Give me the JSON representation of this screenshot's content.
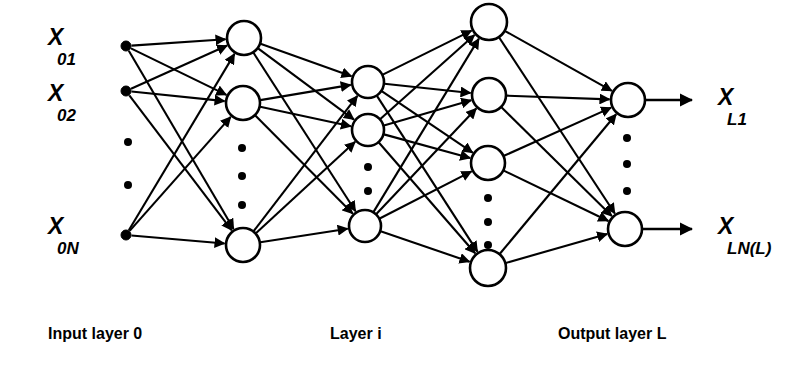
{
  "figure": {
    "kind": "neural-network-diagram",
    "background_color": "#ffffff",
    "stroke_color": "#000000",
    "node_fill_color": "#ffffff"
  },
  "input_labels": [
    {
      "base": "X",
      "sub": "01",
      "x": 48,
      "y": 26
    },
    {
      "base": "X",
      "sub": "02",
      "x": 48,
      "y": 82
    },
    {
      "base": "X",
      "sub": "0N",
      "x": 48,
      "y": 215
    }
  ],
  "output_labels": [
    {
      "base": "X",
      "sub": "L1",
      "x": 718,
      "y": 86
    },
    {
      "base": "X",
      "sub": "LN(L)",
      "x": 718,
      "y": 215
    }
  ],
  "captions": [
    {
      "text": "Input layer 0",
      "x": 48,
      "y": 326
    },
    {
      "text": "Layer i",
      "x": 330,
      "y": 326
    },
    {
      "text": "Output layer L",
      "x": 558,
      "y": 326
    }
  ],
  "layers": [
    {
      "name": "input-layer-0",
      "node_style": "filled-dot",
      "nodes": [
        {
          "id": "in-1",
          "cx": 126,
          "cy": 46,
          "r": 5
        },
        {
          "id": "in-2",
          "cx": 126,
          "cy": 91,
          "r": 5
        },
        {
          "id": "in-3",
          "cx": 126,
          "cy": 235,
          "r": 5
        }
      ],
      "ellipsis": [
        {
          "cx": 128,
          "cy": 142,
          "r": 4
        },
        {
          "cx": 128,
          "cy": 185,
          "r": 4
        }
      ]
    },
    {
      "name": "hidden-layer-1",
      "node_style": "open-circle",
      "nodes": [
        {
          "id": "h1-1",
          "cx": 244,
          "cy": 38,
          "r": 17
        },
        {
          "id": "h1-2",
          "cx": 243,
          "cy": 103,
          "r": 17
        },
        {
          "id": "h1-3",
          "cx": 243,
          "cy": 245,
          "r": 17
        }
      ],
      "ellipsis": [
        {
          "cx": 242,
          "cy": 148,
          "r": 4
        },
        {
          "cx": 242,
          "cy": 176,
          "r": 4
        },
        {
          "cx": 242,
          "cy": 205,
          "r": 4
        }
      ]
    },
    {
      "name": "hidden-layer-i",
      "node_style": "open-circle",
      "nodes": [
        {
          "id": "h2-1",
          "cx": 368,
          "cy": 82,
          "r": 16
        },
        {
          "id": "h2-2",
          "cx": 368,
          "cy": 130,
          "r": 16
        },
        {
          "id": "h2-3",
          "cx": 365,
          "cy": 226,
          "r": 16
        }
      ],
      "ellipsis": [
        {
          "cx": 368,
          "cy": 167,
          "r": 4
        },
        {
          "cx": 368,
          "cy": 191,
          "r": 4
        }
      ]
    },
    {
      "name": "hidden-layer-next",
      "node_style": "open-circle",
      "nodes": [
        {
          "id": "h3-1",
          "cx": 489,
          "cy": 22,
          "r": 18
        },
        {
          "id": "h3-2",
          "cx": 489,
          "cy": 95,
          "r": 17
        },
        {
          "id": "h3-3",
          "cx": 488,
          "cy": 163,
          "r": 17
        },
        {
          "id": "h3-4",
          "cx": 488,
          "cy": 268,
          "r": 18
        }
      ],
      "ellipsis": [
        {
          "cx": 488,
          "cy": 198,
          "r": 4
        },
        {
          "cx": 488,
          "cy": 222,
          "r": 4
        },
        {
          "cx": 488,
          "cy": 245,
          "r": 4
        }
      ]
    },
    {
      "name": "output-layer-L",
      "node_style": "open-circle",
      "nodes": [
        {
          "id": "out-1",
          "cx": 628,
          "cy": 100,
          "r": 17
        },
        {
          "id": "out-2",
          "cx": 625,
          "cy": 229,
          "r": 17
        }
      ],
      "ellipsis": [
        {
          "cx": 627,
          "cy": 138,
          "r": 4
        },
        {
          "cx": 627,
          "cy": 164,
          "r": 4
        },
        {
          "cx": 627,
          "cy": 191,
          "r": 4
        }
      ]
    }
  ],
  "connections": [
    {
      "from": "in-1",
      "to": "h1-1"
    },
    {
      "from": "in-1",
      "to": "h1-2"
    },
    {
      "from": "in-1",
      "to": "h1-3"
    },
    {
      "from": "in-2",
      "to": "h1-1"
    },
    {
      "from": "in-2",
      "to": "h1-2"
    },
    {
      "from": "in-2",
      "to": "h1-3"
    },
    {
      "from": "in-3",
      "to": "h1-1"
    },
    {
      "from": "in-3",
      "to": "h1-2"
    },
    {
      "from": "in-3",
      "to": "h1-3"
    },
    {
      "from": "h1-1",
      "to": "h2-1"
    },
    {
      "from": "h1-1",
      "to": "h2-2"
    },
    {
      "from": "h1-1",
      "to": "h2-3"
    },
    {
      "from": "h1-2",
      "to": "h2-1"
    },
    {
      "from": "h1-2",
      "to": "h2-2"
    },
    {
      "from": "h1-2",
      "to": "h2-3"
    },
    {
      "from": "h1-3",
      "to": "h2-1"
    },
    {
      "from": "h1-3",
      "to": "h2-2"
    },
    {
      "from": "h1-3",
      "to": "h2-3"
    },
    {
      "from": "h2-1",
      "to": "h3-1"
    },
    {
      "from": "h2-1",
      "to": "h3-2"
    },
    {
      "from": "h2-1",
      "to": "h3-3"
    },
    {
      "from": "h2-1",
      "to": "h3-4"
    },
    {
      "from": "h2-2",
      "to": "h3-1"
    },
    {
      "from": "h2-2",
      "to": "h3-2"
    },
    {
      "from": "h2-2",
      "to": "h3-3"
    },
    {
      "from": "h2-2",
      "to": "h3-4"
    },
    {
      "from": "h2-3",
      "to": "h3-1"
    },
    {
      "from": "h2-3",
      "to": "h3-2"
    },
    {
      "from": "h2-3",
      "to": "h3-3"
    },
    {
      "from": "h2-3",
      "to": "h3-4"
    },
    {
      "from": "h3-1",
      "to": "out-1"
    },
    {
      "from": "h3-1",
      "to": "out-2"
    },
    {
      "from": "h3-2",
      "to": "out-1"
    },
    {
      "from": "h3-2",
      "to": "out-2"
    },
    {
      "from": "h3-3",
      "to": "out-1"
    },
    {
      "from": "h3-3",
      "to": "out-2"
    },
    {
      "from": "h3-4",
      "to": "out-1"
    },
    {
      "from": "h3-4",
      "to": "out-2"
    }
  ],
  "output_arrows": [
    {
      "from": "out-1",
      "to_x": 692,
      "label": "X_L1"
    },
    {
      "from": "out-2",
      "to_x": 692,
      "label": "X_LN(L)"
    }
  ]
}
